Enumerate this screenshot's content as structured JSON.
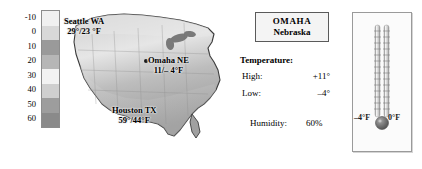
{
  "legend": {
    "name": "temperature-color-scale",
    "ticks": [
      "-10",
      "0",
      "10",
      "20",
      "30",
      "40",
      "50",
      "60"
    ],
    "swatch_colors": [
      "#f0f0f0",
      "#d8d8d8",
      "#9a9a9a",
      "#b6b6b6",
      "#f2f2f2",
      "#cfcfcf",
      "#9d9d9d",
      "#8a8a8a"
    ]
  },
  "map": {
    "name": "us-temperature-map",
    "cities": [
      {
        "id": "seattle",
        "name": "Seattle WA",
        "temp": "29°/23 °F"
      },
      {
        "id": "omaha",
        "name": "Omaha NE",
        "temp": "11/– 4°F"
      },
      {
        "id": "houston",
        "name": "Houston TX",
        "temp": "59°/44°F"
      }
    ]
  },
  "info": {
    "city": "OMAHA",
    "state": "Nebraska",
    "temperature_heading": "Temperature:",
    "rows": [
      {
        "label": "High:",
        "value": "+11°"
      },
      {
        "label": "Low:",
        "value": "–4°"
      }
    ],
    "humidity_label": "Humidity:",
    "humidity_value": "60%"
  },
  "thermometer": {
    "name": "dual-thermometer",
    "left_label": "–4°F",
    "right_label": "0°F",
    "tube_count": 2,
    "bulb_color": "#6e6e6e"
  },
  "chart_data": {
    "type": "heatmap",
    "title": "",
    "xlabel": "",
    "ylabel": "",
    "colorbar_label": "Temperature (°F)",
    "colorbar_ticks": [
      -10,
      0,
      10,
      20,
      30,
      40,
      50,
      60
    ],
    "colorbar_range": [
      -10,
      60
    ],
    "legend": "left",
    "grid": false,
    "annotations": [
      {
        "label": "Seattle WA",
        "high": 29,
        "low": 23,
        "unit": "°F"
      },
      {
        "label": "Omaha NE",
        "high": 11,
        "low": -4,
        "unit": "°F"
      },
      {
        "label": "Houston TX",
        "high": 59,
        "low": 44,
        "unit": "°F"
      }
    ],
    "series": [
      {
        "name": "Omaha NE detail",
        "high": 11,
        "low": -4,
        "humidity_percent": 60
      }
    ]
  }
}
